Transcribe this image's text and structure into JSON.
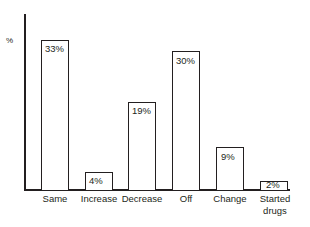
{
  "chart_data": {
    "type": "bar",
    "title": "",
    "xlabel": "",
    "ylabel": "%",
    "categories": [
      "Same",
      "Increase",
      "Decrease",
      "Off",
      "Change",
      "Started\ndrugs"
    ],
    "values": [
      33,
      4,
      19,
      30,
      9,
      2
    ],
    "value_labels": [
      "33%",
      "4%",
      "19%",
      "30%",
      "9%",
      "2%"
    ],
    "ylim": [
      0,
      38
    ],
    "grid": false,
    "legend": "none",
    "bar_style": {
      "fill": "#ffffff",
      "outline": "#231f20"
    }
  },
  "axis": {
    "y_caption": "%"
  },
  "bars": [
    {
      "category": "Same",
      "value": 33,
      "value_label": "33%",
      "left": 41,
      "width": 28,
      "top": 40,
      "height": 150,
      "label_left": 30,
      "label_top": 193,
      "label_width": 50
    },
    {
      "category": "Increase",
      "value": 4,
      "value_label": "4%",
      "left": 85,
      "width": 28,
      "top": 172,
      "height": 18,
      "label_left": 73,
      "label_top": 193,
      "label_width": 52
    },
    {
      "category": "Decrease",
      "value": 19,
      "value_label": "19%",
      "left": 128,
      "width": 28,
      "top": 102,
      "height": 88,
      "label_left": 115,
      "label_top": 193,
      "label_width": 54
    },
    {
      "category": "Off",
      "value": 30,
      "value_label": "30%",
      "left": 172,
      "width": 28,
      "top": 51,
      "height": 139,
      "label_left": 166,
      "label_top": 193,
      "label_width": 40
    },
    {
      "category": "Change",
      "value": 9,
      "value_label": "9%",
      "left": 216,
      "width": 28,
      "top": 147,
      "height": 43,
      "label_left": 205,
      "label_top": 193,
      "label_width": 50
    },
    {
      "category": "Started\ndrugs",
      "value": 2,
      "value_label": "2%",
      "left": 260,
      "width": 28,
      "top": 181,
      "height": 9,
      "label_left": 250,
      "label_top": 193,
      "label_width": 50
    }
  ],
  "value_label_positions": [
    {
      "left": 45,
      "top": 43
    },
    {
      "left": 89,
      "top": 175
    },
    {
      "left": 132,
      "top": 105
    },
    {
      "left": 176,
      "top": 55
    },
    {
      "left": 221,
      "top": 151
    },
    {
      "left": 266,
      "top": 179
    }
  ]
}
